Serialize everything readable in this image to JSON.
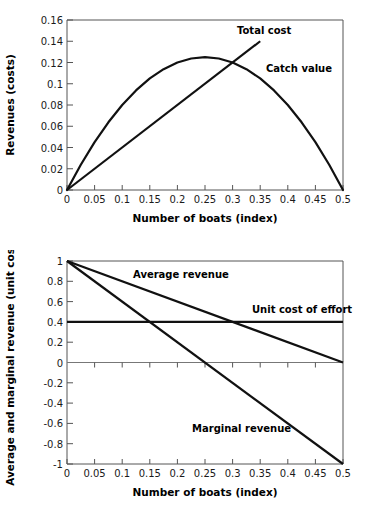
{
  "figures": [
    {
      "id": "total-cost-catch-value",
      "chart_data": {
        "type": "line",
        "title": "",
        "xlabel": "Number of boats (index)",
        "ylabel": "Revenues (costs)",
        "xlim": [
          0,
          0.5
        ],
        "ylim": [
          0,
          0.16
        ],
        "xticks": [
          "0",
          "0.05",
          "0.1",
          "0.15",
          "0.2",
          "0.25",
          "0.3",
          "0.35",
          "0.4",
          "0.45",
          "0.5"
        ],
        "xtick_values": [
          0,
          0.05,
          0.1,
          0.15,
          0.2,
          0.25,
          0.3,
          0.35,
          0.4,
          0.45,
          0.5
        ],
        "yticks": [
          "0",
          "0.02",
          "0.04",
          "0.06",
          "0.08",
          "0.1",
          "0.12",
          "0.14",
          "0.16"
        ],
        "ytick_values": [
          0,
          0.02,
          0.04,
          0.06,
          0.08,
          0.1,
          0.12,
          0.14,
          0.16
        ],
        "grid": false,
        "legend": "inline-annotations",
        "series": [
          {
            "name": "Catch value",
            "shape": "parabola",
            "annotation": "Catch value",
            "x": [
              0,
              0.025,
              0.05,
              0.075,
              0.1,
              0.125,
              0.15,
              0.175,
              0.2,
              0.225,
              0.25,
              0.275,
              0.3,
              0.325,
              0.35,
              0.375,
              0.4,
              0.425,
              0.45,
              0.475,
              0.5
            ],
            "values": [
              0,
              0.02375,
              0.045,
              0.06375,
              0.08,
              0.09375,
              0.105,
              0.11375,
              0.12,
              0.12375,
              0.125,
              0.12375,
              0.12,
              0.11375,
              0.105,
              0.09375,
              0.08,
              0.06375,
              0.045,
              0.02375,
              0
            ]
          },
          {
            "name": "Total cost",
            "shape": "straight-line",
            "annotation": "Total cost",
            "x": [
              0,
              0.35
            ],
            "values": [
              0,
              0.14
            ]
          }
        ],
        "annotations": [
          {
            "text": "Total cost",
            "x": 0.235,
            "y": 0.1485
          },
          {
            "text": "Catch value",
            "x": 0.29,
            "y": 0.1135
          }
        ],
        "notes": "Catch value peaks at 0.125 when boats = 0.25; total cost line crosses catch value near boats = 0.3"
      }
    },
    {
      "id": "average-marginal-revenue",
      "chart_data": {
        "type": "line",
        "title": "",
        "xlabel": "Number of boats (index)",
        "ylabel": "Average and marginal revenue (unit cost)",
        "xlim": [
          0,
          0.5
        ],
        "ylim": [
          -1,
          1
        ],
        "xticks": [
          "0",
          "0.05",
          "0.1",
          "0.15",
          "0.2",
          "0.25",
          "0.3",
          "0.35",
          "0.4",
          "0.45",
          "0.5"
        ],
        "xtick_values": [
          0,
          0.05,
          0.1,
          0.15,
          0.2,
          0.25,
          0.3,
          0.35,
          0.4,
          0.45,
          0.5
        ],
        "yticks": [
          "1",
          "0.8",
          "0.6",
          "0.4",
          "0.2",
          "0",
          "-0.2",
          "-0.4",
          "-0.6",
          "-0.8",
          "-1"
        ],
        "ytick_values": [
          1,
          0.8,
          0.6,
          0.4,
          0.2,
          0,
          -0.2,
          -0.4,
          -0.6,
          -0.8,
          -1
        ],
        "grid": false,
        "legend": "inline-annotations",
        "series": [
          {
            "name": "Average revenue",
            "shape": "straight-line",
            "annotation": "Average revenue",
            "x": [
              0,
              0.5
            ],
            "values": [
              1,
              0
            ]
          },
          {
            "name": "Marginal revenue",
            "shape": "straight-line",
            "annotation": "Marginal revenue",
            "x": [
              0,
              0.5
            ],
            "values": [
              1,
              -1
            ]
          },
          {
            "name": "Unit cost of effort",
            "shape": "horizontal-line",
            "annotation": "Unit cost of effort",
            "x": [
              0,
              0.5
            ],
            "values": [
              0.4,
              0.4
            ]
          }
        ],
        "annotations": [
          {
            "text": "Average revenue",
            "x": 0.1,
            "y": 0.845
          },
          {
            "text": "Unit cost of effort",
            "x": 0.285,
            "y": 0.49
          },
          {
            "text": "Marginal revenue",
            "x": 0.19,
            "y": -0.605
          }
        ],
        "notes": "Marginal revenue crosses unit cost of effort at boats = 0.15; average revenue crosses unit cost of effort at boats = 0.30; marginal revenue hits zero at boats = 0.25"
      }
    }
  ]
}
